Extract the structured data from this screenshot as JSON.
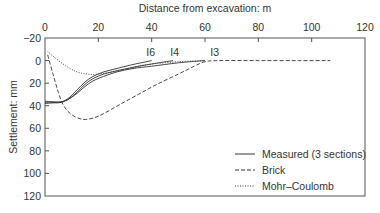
{
  "chart_data": {
    "type": "line",
    "title": "",
    "xlabel": "Distance from excavation: m",
    "ylabel": "Settlement: mm",
    "xlim": [
      0,
      120
    ],
    "ylim": [
      -20,
      120
    ],
    "y_inverted": true,
    "x_axis_position": "top",
    "x_ticks": [
      0,
      20,
      40,
      60,
      80,
      100,
      120
    ],
    "y_ticks": [
      -20,
      0,
      20,
      40,
      60,
      80,
      100,
      120
    ],
    "grid": false,
    "legend_position": "lower right",
    "series": [
      {
        "name": "Measured I6",
        "legend_group": "Measured (3 sections)",
        "style": "solid",
        "label": "I6",
        "points": [
          [
            0,
            38
          ],
          [
            3,
            37.5
          ],
          [
            6,
            37
          ],
          [
            9,
            33
          ],
          [
            12,
            26
          ],
          [
            15,
            19
          ],
          [
            18,
            14
          ],
          [
            22,
            10
          ],
          [
            27,
            7
          ],
          [
            32,
            4
          ],
          [
            36,
            2
          ],
          [
            40,
            0
          ]
        ]
      },
      {
        "name": "Measured I4",
        "legend_group": "Measured (3 sections)",
        "style": "solid",
        "label": "I4",
        "points": [
          [
            0,
            37
          ],
          [
            3,
            37
          ],
          [
            6,
            37
          ],
          [
            9,
            34
          ],
          [
            12,
            28
          ],
          [
            15,
            21
          ],
          [
            18,
            16
          ],
          [
            22,
            12
          ],
          [
            27,
            9
          ],
          [
            33,
            6
          ],
          [
            40,
            3
          ],
          [
            48,
            0
          ]
        ]
      },
      {
        "name": "Measured I3",
        "legend_group": "Measured (3 sections)",
        "style": "solid",
        "label": "I3",
        "points": [
          [
            0,
            36
          ],
          [
            3,
            36.5
          ],
          [
            6,
            36.5
          ],
          [
            9,
            34
          ],
          [
            12,
            29
          ],
          [
            15,
            23
          ],
          [
            18,
            18
          ],
          [
            22,
            14
          ],
          [
            27,
            10
          ],
          [
            33,
            7
          ],
          [
            40,
            5
          ],
          [
            50,
            2
          ],
          [
            60,
            0
          ]
        ]
      },
      {
        "name": "Brick",
        "legend_group": "Brick",
        "style": "dashed",
        "points": [
          [
            1,
            -5
          ],
          [
            3,
            12
          ],
          [
            5,
            28
          ],
          [
            7,
            40
          ],
          [
            10,
            48
          ],
          [
            14,
            52
          ],
          [
            18,
            51
          ],
          [
            22,
            47
          ],
          [
            28,
            39
          ],
          [
            35,
            30
          ],
          [
            42,
            21
          ],
          [
            50,
            12
          ],
          [
            56,
            5
          ],
          [
            60,
            1
          ],
          [
            65,
            0
          ],
          [
            80,
            0
          ],
          [
            95,
            0
          ],
          [
            107,
            0
          ]
        ]
      },
      {
        "name": "Mohr–Coulomb",
        "legend_group": "Mohr–Coulomb",
        "style": "dotted",
        "points": [
          [
            1,
            -8
          ],
          [
            4,
            -2
          ],
          [
            8,
            5
          ],
          [
            12,
            10
          ],
          [
            16,
            12
          ],
          [
            20,
            12
          ],
          [
            25,
            10
          ],
          [
            30,
            8
          ],
          [
            35,
            5
          ],
          [
            40,
            3
          ],
          [
            50,
            1
          ],
          [
            60,
            0
          ]
        ]
      }
    ],
    "annotations": [
      {
        "text": "I6",
        "x": 38,
        "y": -4
      },
      {
        "text": "I4",
        "x": 47,
        "y": -4
      },
      {
        "text": "I3",
        "x": 62,
        "y": -4
      }
    ],
    "legend": [
      {
        "label": "Measured (3 sections)",
        "style": "solid"
      },
      {
        "label": "Brick",
        "style": "dashed"
      },
      {
        "label": "Mohr–Coulomb",
        "style": "dotted"
      }
    ]
  },
  "labels": {
    "xlabel": "Distance from excavation: m",
    "ylabel": "Settlement: mm",
    "legend_measured": "Measured (3 sections)",
    "legend_brick": "Brick",
    "legend_mc": "Mohr–Coulomb",
    "x_ticks": [
      "0",
      "20",
      "40",
      "60",
      "80",
      "100",
      "120"
    ],
    "y_ticks": [
      "−20",
      "0",
      "20",
      "40",
      "60",
      "80",
      "100",
      "120"
    ],
    "curve_labels": [
      "I6",
      "I4",
      "I3"
    ]
  },
  "colors": {
    "line": "#333333",
    "frame": "#555555",
    "text": "#333333",
    "background": "#ffffff"
  }
}
